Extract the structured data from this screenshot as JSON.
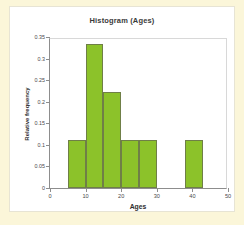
{
  "chart_data": {
    "type": "bar",
    "title": "Histogram  (Ages)",
    "xlabel": "Ages",
    "ylabel": "Relative frequency",
    "xlim": [
      0,
      50
    ],
    "ylim": [
      0,
      0.35
    ],
    "grid": false,
    "legend": null,
    "bar_color": "#8cc22a",
    "bar_edge_color": "#6f7f47",
    "xticks": [
      0,
      10,
      20,
      30,
      40,
      50
    ],
    "xtick_labels": [
      "0",
      "10",
      "20",
      "30",
      "40",
      "50"
    ],
    "yticks": [
      0,
      0.05,
      0.1,
      0.15,
      0.2,
      0.25,
      0.3,
      0.35
    ],
    "ytick_labels": [
      "0",
      "0.05",
      "0.1",
      "0.15",
      "0.2",
      "0.25",
      "0.3",
      "0.35"
    ],
    "bins": [
      {
        "start": 5,
        "end": 10,
        "value": 0.111
      },
      {
        "start": 10,
        "end": 15,
        "value": 0.333
      },
      {
        "start": 15,
        "end": 20,
        "value": 0.222
      },
      {
        "start": 20,
        "end": 25,
        "value": 0.111
      },
      {
        "start": 25,
        "end": 30,
        "value": 0.111
      },
      {
        "start": 38,
        "end": 43,
        "value": 0.111
      }
    ],
    "categories": [
      "5-10",
      "10-15",
      "15-20",
      "20-25",
      "25-30",
      "38-43"
    ],
    "values": [
      0.111,
      0.333,
      0.222,
      0.111,
      0.111,
      0.111
    ]
  },
  "page": {
    "background_color": "#fbf6d9",
    "card_color": "#ffffff"
  }
}
